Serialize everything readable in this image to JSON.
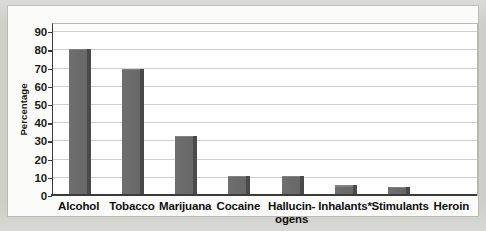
{
  "figure": {
    "background_color": "#cfcfca",
    "plate_color": "#fbfbf9",
    "bar_color": "#6e6e6e",
    "bar_shadow_color": "#4a4a4a",
    "axis_color": "#3b3b3b",
    "gridline_color": "#cfcfcb"
  },
  "chart_data": {
    "type": "bar",
    "title": "",
    "xlabel": "",
    "ylabel": "Percentage",
    "categories": [
      "Alcohol",
      "Tobacco",
      "Marijuana",
      "Cocaine",
      "Hallucin-ogens",
      "Inhalants*",
      "Stimulants",
      "Heroin"
    ],
    "category_lines": [
      [
        "Alcohol"
      ],
      [
        "Tobacco"
      ],
      [
        "Marijuana"
      ],
      [
        "Cocaine"
      ],
      [
        "Hallucin-",
        "ogens"
      ],
      [
        "Inhalants*"
      ],
      [
        "Stimulants"
      ],
      [
        "Heroin"
      ]
    ],
    "values": [
      81,
      70,
      33,
      11,
      11,
      6,
      5,
      1
    ],
    "ylim": [
      0,
      95
    ],
    "yticks": [
      0,
      10,
      20,
      30,
      40,
      50,
      60,
      70,
      80,
      90
    ],
    "ytick_labels": [
      "0",
      "10",
      "20",
      "30",
      "40",
      "50",
      "60",
      "70",
      "80",
      "90"
    ],
    "grid": true,
    "legend": null
  }
}
